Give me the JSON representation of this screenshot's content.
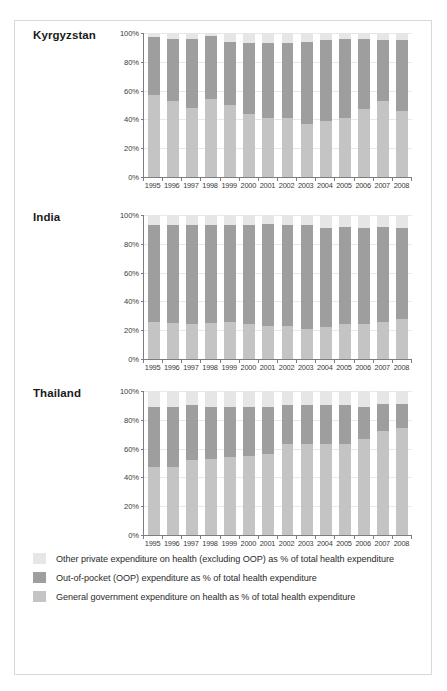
{
  "chart_data": [
    {
      "type": "bar",
      "title": "Kyrgyzstan",
      "xlabel": "",
      "ylabel": "",
      "ylim": [
        0,
        100
      ],
      "yticks": [
        0,
        20,
        40,
        60,
        80,
        100
      ],
      "ytick_labels": [
        "0%",
        "20%",
        "40%",
        "60%",
        "80%",
        "100%"
      ],
      "grid": true,
      "stacked": true,
      "legend_position": "bottom",
      "categories": [
        "1995",
        "1996",
        "1997",
        "1998",
        "1999",
        "2000",
        "2001",
        "2002",
        "2003",
        "2004",
        "2005",
        "2006",
        "2007",
        "2008"
      ],
      "series": [
        {
          "name": "General government expenditure on health as % of total health expenditure",
          "color": "#c4c4c4",
          "values": [
            57,
            53,
            48,
            54,
            50,
            44,
            41,
            41,
            37,
            39,
            41,
            47,
            53,
            46
          ]
        },
        {
          "name": "Out-of-pocket (OOP) expenditure as % of total health expenditure",
          "color": "#9e9e9e",
          "values": [
            40,
            43,
            48,
            44,
            44,
            49,
            52,
            52,
            57,
            56,
            55,
            49,
            42,
            49
          ]
        },
        {
          "name": "Other private expenditure on health (excluding OOP) as % of total health expenditure",
          "color": "#e6e6e6",
          "values": [
            3,
            4,
            4,
            2,
            6,
            7,
            7,
            7,
            6,
            5,
            4,
            4,
            5,
            5
          ]
        }
      ]
    },
    {
      "type": "bar",
      "title": "India",
      "xlabel": "",
      "ylabel": "",
      "ylim": [
        0,
        100
      ],
      "yticks": [
        0,
        20,
        40,
        60,
        80,
        100
      ],
      "ytick_labels": [
        "0%",
        "20%",
        "40%",
        "60%",
        "80%",
        "100%"
      ],
      "grid": true,
      "stacked": true,
      "legend_position": "bottom",
      "categories": [
        "1995",
        "1996",
        "1997",
        "1998",
        "1999",
        "2000",
        "2001",
        "2002",
        "2003",
        "2004",
        "2005",
        "2006",
        "2007",
        "2008"
      ],
      "series": [
        {
          "name": "General government expenditure on health as % of total health expenditure",
          "color": "#c4c4c4",
          "values": [
            26,
            25,
            24,
            25,
            26,
            24,
            23,
            23,
            21,
            22,
            24,
            24,
            26,
            28
          ]
        },
        {
          "name": "Out-of-pocket (OOP) expenditure as % of total health expenditure",
          "color": "#9e9e9e",
          "values": [
            67,
            68,
            69,
            68,
            67,
            69,
            71,
            70,
            72,
            69,
            68,
            67,
            66,
            63
          ]
        },
        {
          "name": "Other private expenditure on health (excluding OOP) as % of total health expenditure",
          "color": "#e6e6e6",
          "values": [
            7,
            7,
            7,
            7,
            7,
            7,
            6,
            7,
            7,
            9,
            8,
            9,
            8,
            9
          ]
        }
      ]
    },
    {
      "type": "bar",
      "title": "Thailand",
      "xlabel": "",
      "ylabel": "",
      "ylim": [
        0,
        100
      ],
      "yticks": [
        0,
        20,
        40,
        60,
        80,
        100
      ],
      "ytick_labels": [
        "0%",
        "20%",
        "40%",
        "60%",
        "80%",
        "100%"
      ],
      "grid": true,
      "stacked": true,
      "legend_position": "bottom",
      "categories": [
        "1995",
        "1996",
        "1997",
        "1998",
        "1999",
        "2000",
        "2001",
        "2002",
        "2003",
        "2004",
        "2005",
        "2006",
        "2007",
        "2008"
      ],
      "series": [
        {
          "name": "General government expenditure on health as % of total health expenditure",
          "color": "#c4c4c4",
          "values": [
            47,
            47,
            52,
            53,
            54,
            55,
            56,
            63,
            63,
            63,
            63,
            67,
            72,
            74
          ]
        },
        {
          "name": "Out-of-pocket (OOP) expenditure as % of total health expenditure",
          "color": "#9e9e9e",
          "values": [
            42,
            42,
            38,
            36,
            35,
            34,
            33,
            27,
            27,
            27,
            27,
            22,
            19,
            17
          ]
        },
        {
          "name": "Other private expenditure on health (excluding OOP) as % of total health expenditure",
          "color": "#e6e6e6",
          "values": [
            11,
            11,
            10,
            11,
            11,
            11,
            11,
            10,
            10,
            10,
            10,
            11,
            9,
            9
          ]
        }
      ]
    }
  ],
  "legend": {
    "items": [
      {
        "label": "Other private expenditure on health (excluding OOP) as % of total health expenditure",
        "color": "#e6e6e6",
        "key": "other"
      },
      {
        "label": "Out-of-pocket (OOP) expenditure as % of total health expenditure",
        "color": "#9e9e9e",
        "key": "oop"
      },
      {
        "label": "General government expenditure on health as % of total health expenditure",
        "color": "#c4c4c4",
        "key": "gov"
      }
    ]
  }
}
